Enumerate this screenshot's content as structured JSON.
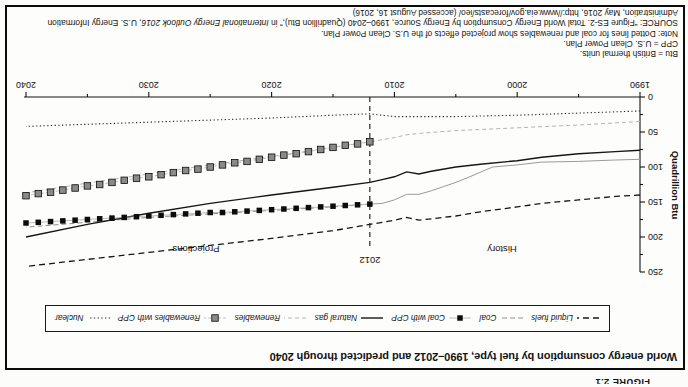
{
  "page": {
    "background": "#fcfcfb",
    "orientation": "rotated-180"
  },
  "figure": {
    "caption": "FIGURE 2.1",
    "title": "World energy consumption by fuel type, 1990–2012 and predicted through 2040",
    "notes": [
      "Btu = British thermal units.",
      "CPP = U.S. Clean Power Plan.",
      "Note: Dotted lines for coal and renewables show projected effects of the U.S. Clean Power Plan."
    ],
    "source": {
      "prefix": "SOURCE: “Figure ES-2. Total World Energy Consumption by Energy Source, 1990–2040 (Quadrillion Btu),” in ",
      "italic": "International Energy Outlook 2016",
      "suffix": ", U.S. Energy Information Administration, May 2016, http://www.eia.gov/forecasts/ieo/ (accessed August 16, 2016)"
    }
  },
  "legend": {
    "position": "top",
    "items": [
      {
        "label": "Liquid fuels",
        "style": "dash-black"
      },
      {
        "label": "Coal",
        "style": "dash-gray"
      },
      {
        "label": "Coal with CPP",
        "style": "squares-black"
      },
      {
        "label": "Natural gas",
        "style": "solid-black"
      },
      {
        "label": "Renewables",
        "style": "dash-lightgray"
      },
      {
        "label": "Renewables with CPP",
        "style": "squares-gray"
      },
      {
        "label": "Nuclear",
        "style": "dotted-black"
      }
    ]
  },
  "chart_data": {
    "type": "line",
    "title": "World energy consumption by fuel type, 1990–2012 and predicted through 2040",
    "xlabel": "",
    "ylabel": "Quadrillion Btu",
    "xlim": [
      1990,
      2040
    ],
    "ylim": [
      0,
      250
    ],
    "xticks": [
      1990,
      2000,
      2010,
      2020,
      2030,
      2040
    ],
    "yticks": [
      0,
      50,
      100,
      150,
      200,
      250
    ],
    "grid": false,
    "legend_position": "top",
    "divider": {
      "year": 2012,
      "label": "2012"
    },
    "annotations": [
      {
        "text": "History",
        "x": 186,
        "y": 141,
        "size": 9.5
      },
      {
        "text": "Projections",
        "x": 492,
        "y": 141,
        "size": 9.5
      },
      {
        "text": "2012",
        "x": 318,
        "y": 130,
        "size": 9.5
      }
    ],
    "colors": {
      "ink": "#161616",
      "gray": "#8f8f8f",
      "light_gray": "#b3b3b3",
      "square_gray": "#8a8a8a"
    },
    "series": [
      {
        "id": "liquid-fuels",
        "name": "Liquid fuels",
        "style": "dash-black",
        "x": [
          1990,
          1992,
          1995,
          1998,
          2000,
          2003,
          2005,
          2007,
          2008,
          2009,
          2010,
          2011,
          2012,
          2015,
          2020,
          2025,
          2030,
          2035,
          2040
        ],
        "values": [
          140,
          142,
          147,
          152,
          157,
          164,
          170,
          174,
          176,
          172,
          176,
          179,
          182,
          191,
          202,
          212,
          222,
          232,
          242
        ]
      },
      {
        "id": "coal-history",
        "name": "Coal (history)",
        "style": "solid-gray",
        "x": [
          1990,
          1992,
          1995,
          1998,
          2000,
          2002,
          2004,
          2005,
          2006,
          2007,
          2008,
          2009,
          2010,
          2011,
          2012
        ],
        "values": [
          89,
          90,
          92,
          93,
          97,
          100,
          115,
          122,
          128,
          134,
          139,
          139,
          147,
          152,
          153
        ]
      },
      {
        "id": "coal-projection",
        "name": "Coal (projection)",
        "style": "dash-gray",
        "x": [
          2012,
          2015,
          2020,
          2025,
          2030,
          2035,
          2040
        ],
        "values": [
          153,
          157,
          162,
          167,
          172,
          179,
          186
        ]
      },
      {
        "id": "natural-gas",
        "name": "Natural gas",
        "style": "solid-black",
        "x": [
          1990,
          1992,
          1995,
          1998,
          2000,
          2003,
          2005,
          2007,
          2008,
          2009,
          2010,
          2011,
          2012,
          2015,
          2020,
          2025,
          2030,
          2035,
          2040
        ],
        "values": [
          76,
          78,
          81,
          86,
          91,
          96,
          100,
          106,
          110,
          107,
          114,
          118,
          122,
          129,
          140,
          152,
          166,
          182,
          200
        ]
      },
      {
        "id": "renewables",
        "name": "Renewables",
        "style": "dash-lightgray",
        "x": [
          1990,
          1995,
          2000,
          2005,
          2008,
          2009,
          2010,
          2011,
          2012,
          2015,
          2020,
          2025,
          2030,
          2035,
          2040
        ],
        "values": [
          35,
          40,
          44,
          48,
          52,
          54,
          58,
          61,
          64,
          72,
          85,
          97,
          110,
          123,
          137
        ]
      },
      {
        "id": "nuclear",
        "name": "Nuclear",
        "style": "dotted-black",
        "x": [
          1990,
          1995,
          2000,
          2005,
          2008,
          2010,
          2011,
          2012,
          2015,
          2020,
          2025,
          2030,
          2035,
          2040
        ],
        "values": [
          20,
          23,
          26,
          28,
          28,
          28,
          26,
          24,
          26,
          30,
          33,
          36,
          39,
          42
        ]
      },
      {
        "id": "coal-with-cpp",
        "name": "Coal with CPP",
        "style": "squares-black",
        "x": [
          2012,
          2013,
          2014,
          2015,
          2016,
          2017,
          2018,
          2019,
          2020,
          2021,
          2022,
          2023,
          2024,
          2025,
          2026,
          2027,
          2028,
          2029,
          2030,
          2031,
          2032,
          2033,
          2034,
          2035,
          2036,
          2037,
          2038,
          2039,
          2040
        ],
        "values": [
          153,
          154,
          155,
          156,
          157,
          158,
          159,
          160,
          161,
          162,
          163,
          164,
          165,
          165,
          166,
          167,
          168,
          169,
          170,
          171,
          172,
          173,
          174,
          175,
          176,
          177,
          178,
          179,
          180
        ]
      },
      {
        "id": "renewables-with-cpp",
        "name": "Renewables with CPP",
        "style": "squares-gray",
        "x": [
          2012,
          2013,
          2014,
          2015,
          2016,
          2017,
          2018,
          2019,
          2020,
          2021,
          2022,
          2023,
          2024,
          2025,
          2026,
          2027,
          2028,
          2029,
          2030,
          2031,
          2032,
          2033,
          2034,
          2035,
          2036,
          2037,
          2038,
          2039,
          2040
        ],
        "values": [
          64,
          67,
          69,
          72,
          75,
          78,
          81,
          83,
          86,
          89,
          92,
          94,
          97,
          100,
          103,
          105,
          108,
          111,
          114,
          116,
          119,
          122,
          125,
          127,
          130,
          133,
          136,
          138,
          141
        ]
      }
    ]
  }
}
